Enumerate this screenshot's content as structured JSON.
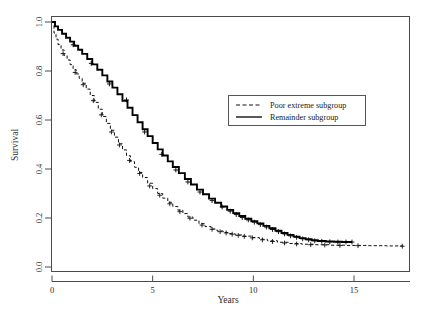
{
  "chart_data": {
    "type": "line",
    "title": "",
    "xlabel": "Years",
    "ylabel": "Survival",
    "xlim": [
      0,
      17.8
    ],
    "ylim": [
      0.0,
      1.0
    ],
    "xticks": [
      0,
      5,
      10,
      15
    ],
    "xtick_labels": [
      "0",
      "5",
      "10",
      "15"
    ],
    "yticks": [
      0.0,
      0.2,
      0.4,
      0.6,
      0.8,
      1.0
    ],
    "ytick_labels": [
      "0.0",
      "0.2",
      "0.4",
      "0.6",
      "0.8",
      "1.0"
    ],
    "grid": false,
    "legend_position": "upper-right-inset",
    "series": [
      {
        "name": "Poor extreme subgroup",
        "style": "dashed",
        "color": "#111111",
        "censor_marker": "plus",
        "points": [
          [
            0.0,
            1.0
          ],
          [
            0.1,
            0.955
          ],
          [
            0.2,
            0.93
          ],
          [
            0.3,
            0.908
          ],
          [
            0.45,
            0.886
          ],
          [
            0.6,
            0.864
          ],
          [
            0.75,
            0.845
          ],
          [
            0.9,
            0.826
          ],
          [
            1.05,
            0.806
          ],
          [
            1.2,
            0.788
          ],
          [
            1.35,
            0.77
          ],
          [
            1.5,
            0.75
          ],
          [
            1.7,
            0.726
          ],
          [
            1.9,
            0.7
          ],
          [
            2.1,
            0.672
          ],
          [
            2.3,
            0.644
          ],
          [
            2.5,
            0.614
          ],
          [
            2.7,
            0.586
          ],
          [
            2.9,
            0.558
          ],
          [
            3.1,
            0.53
          ],
          [
            3.3,
            0.503
          ],
          [
            3.5,
            0.478
          ],
          [
            3.7,
            0.454
          ],
          [
            3.9,
            0.43
          ],
          [
            4.1,
            0.407
          ],
          [
            4.3,
            0.386
          ],
          [
            4.5,
            0.365
          ],
          [
            4.75,
            0.342
          ],
          [
            5.0,
            0.32
          ],
          [
            5.25,
            0.3
          ],
          [
            5.5,
            0.281
          ],
          [
            5.75,
            0.264
          ],
          [
            6.0,
            0.247
          ],
          [
            6.25,
            0.232
          ],
          [
            6.5,
            0.218
          ],
          [
            6.75,
            0.204
          ],
          [
            7.0,
            0.191
          ],
          [
            7.3,
            0.177
          ],
          [
            7.6,
            0.165
          ],
          [
            7.9,
            0.155
          ],
          [
            8.2,
            0.147
          ],
          [
            8.5,
            0.141
          ],
          [
            8.8,
            0.136
          ],
          [
            9.1,
            0.131
          ],
          [
            9.5,
            0.126
          ],
          [
            9.9,
            0.12
          ],
          [
            10.3,
            0.113
          ],
          [
            10.7,
            0.107
          ],
          [
            11.2,
            0.101
          ],
          [
            11.8,
            0.096
          ],
          [
            12.4,
            0.093
          ],
          [
            13.0,
            0.091
          ],
          [
            13.8,
            0.089
          ],
          [
            14.6,
            0.088
          ],
          [
            15.6,
            0.087
          ],
          [
            16.6,
            0.086
          ],
          [
            17.4,
            0.085
          ]
        ],
        "censor_points": [
          [
            0.55,
            0.871
          ],
          [
            1.15,
            0.794
          ],
          [
            1.55,
            0.744
          ],
          [
            2.05,
            0.679
          ],
          [
            2.45,
            0.621
          ],
          [
            2.95,
            0.551
          ],
          [
            3.35,
            0.498
          ],
          [
            3.85,
            0.435
          ],
          [
            4.35,
            0.382
          ],
          [
            4.85,
            0.331
          ],
          [
            5.35,
            0.293
          ],
          [
            5.85,
            0.258
          ],
          [
            6.35,
            0.226
          ],
          [
            6.85,
            0.199
          ],
          [
            7.45,
            0.171
          ],
          [
            7.95,
            0.154
          ],
          [
            8.35,
            0.144
          ],
          [
            8.65,
            0.139
          ],
          [
            8.95,
            0.134
          ],
          [
            9.25,
            0.129
          ],
          [
            9.55,
            0.125
          ],
          [
            9.95,
            0.119
          ],
          [
            10.45,
            0.111
          ],
          [
            10.95,
            0.104
          ],
          [
            11.55,
            0.098
          ],
          [
            12.15,
            0.094
          ],
          [
            12.85,
            0.091
          ],
          [
            13.55,
            0.09
          ],
          [
            14.3,
            0.088
          ],
          [
            15.2,
            0.087
          ],
          [
            17.4,
            0.085
          ]
        ]
      },
      {
        "name": "Remainder subgroup",
        "style": "solid",
        "color": "#000000",
        "censor_marker": "plus",
        "points": [
          [
            0.0,
            1.0
          ],
          [
            0.15,
            0.982
          ],
          [
            0.3,
            0.968
          ],
          [
            0.5,
            0.952
          ],
          [
            0.7,
            0.936
          ],
          [
            0.9,
            0.92
          ],
          [
            1.1,
            0.903
          ],
          [
            1.3,
            0.887
          ],
          [
            1.5,
            0.87
          ],
          [
            1.75,
            0.849
          ],
          [
            2.0,
            0.827
          ],
          [
            2.25,
            0.805
          ],
          [
            2.5,
            0.782
          ],
          [
            2.75,
            0.757
          ],
          [
            3.0,
            0.732
          ],
          [
            3.25,
            0.705
          ],
          [
            3.5,
            0.678
          ],
          [
            3.75,
            0.65
          ],
          [
            4.0,
            0.62
          ],
          [
            4.25,
            0.591
          ],
          [
            4.5,
            0.562
          ],
          [
            4.75,
            0.534
          ],
          [
            5.0,
            0.506
          ],
          [
            5.25,
            0.48
          ],
          [
            5.5,
            0.455
          ],
          [
            5.75,
            0.431
          ],
          [
            6.0,
            0.408
          ],
          [
            6.3,
            0.383
          ],
          [
            6.6,
            0.359
          ],
          [
            6.9,
            0.337
          ],
          [
            7.2,
            0.316
          ],
          [
            7.5,
            0.297
          ],
          [
            7.8,
            0.279
          ],
          [
            8.1,
            0.262
          ],
          [
            8.4,
            0.247
          ],
          [
            8.7,
            0.233
          ],
          [
            9.0,
            0.22
          ],
          [
            9.3,
            0.208
          ],
          [
            9.6,
            0.197
          ],
          [
            9.9,
            0.187
          ],
          [
            10.2,
            0.178
          ],
          [
            10.5,
            0.168
          ],
          [
            10.8,
            0.158
          ],
          [
            11.1,
            0.148
          ],
          [
            11.4,
            0.139
          ],
          [
            11.7,
            0.131
          ],
          [
            12.0,
            0.124
          ],
          [
            12.3,
            0.118
          ],
          [
            12.6,
            0.113
          ],
          [
            12.9,
            0.109
          ],
          [
            13.2,
            0.106
          ],
          [
            13.6,
            0.104
          ],
          [
            14.0,
            0.103
          ],
          [
            14.4,
            0.102
          ],
          [
            14.9,
            0.102
          ]
        ],
        "censor_points": [
          [
            1.05,
            0.907
          ],
          [
            1.95,
            0.831
          ],
          [
            2.85,
            0.747
          ],
          [
            3.7,
            0.682
          ],
          [
            4.6,
            0.551
          ],
          [
            5.45,
            0.46
          ],
          [
            6.15,
            0.396
          ],
          [
            6.75,
            0.347
          ],
          [
            7.35,
            0.306
          ],
          [
            7.95,
            0.271
          ],
          [
            8.45,
            0.245
          ],
          [
            8.85,
            0.228
          ],
          [
            9.15,
            0.214
          ],
          [
            9.45,
            0.202
          ],
          [
            9.75,
            0.192
          ],
          [
            10.05,
            0.183
          ],
          [
            10.35,
            0.173
          ],
          [
            10.65,
            0.163
          ],
          [
            10.95,
            0.153
          ],
          [
            11.25,
            0.144
          ],
          [
            11.55,
            0.135
          ],
          [
            11.85,
            0.127
          ],
          [
            12.15,
            0.121
          ],
          [
            12.45,
            0.115
          ],
          [
            12.75,
            0.111
          ],
          [
            13.05,
            0.107
          ],
          [
            13.4,
            0.105
          ],
          [
            13.8,
            0.103
          ],
          [
            14.2,
            0.102
          ],
          [
            14.6,
            0.102
          ],
          [
            14.9,
            0.102
          ]
        ]
      }
    ]
  },
  "legend": {
    "entries": [
      {
        "label": "Poor extreme subgroup",
        "style": "dashed"
      },
      {
        "label": "Remainder subgroup",
        "style": "solid"
      }
    ]
  },
  "colors": {
    "frame": "#4a4a4a",
    "background": "#ffffff",
    "ink": "#111111",
    "legend_border": "#555555"
  }
}
